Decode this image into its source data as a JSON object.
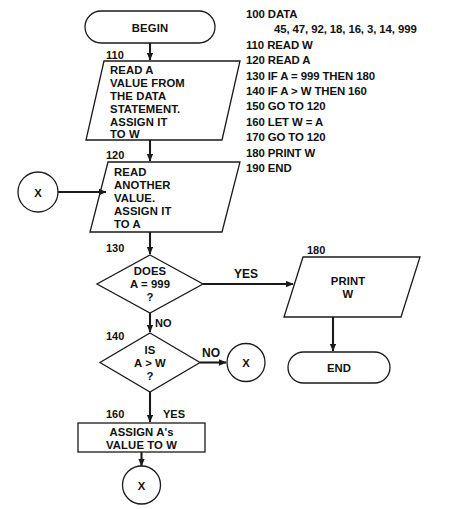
{
  "diagram": {
    "nodes": {
      "begin": {
        "label": "BEGIN",
        "type": "terminator"
      },
      "read_w": {
        "step": "110",
        "type": "io-parallelogram",
        "lines": [
          "READ A",
          "VALUE FROM",
          "THE DATA",
          "STATEMENT.",
          "ASSIGN IT",
          "TO W"
        ]
      },
      "read_a": {
        "step": "120",
        "type": "io-parallelogram",
        "lines": [
          "READ",
          "ANOTHER",
          "VALUE.",
          "ASSIGN IT",
          "TO A"
        ]
      },
      "test_999": {
        "step": "130",
        "type": "decision",
        "lines": [
          "DOES",
          "A = 999",
          "?"
        ]
      },
      "test_gt": {
        "step": "140",
        "type": "decision",
        "lines": [
          "IS",
          "A > W",
          "?"
        ]
      },
      "assign": {
        "step": "160",
        "type": "process",
        "lines": [
          "ASSIGN A's",
          "VALUE TO W"
        ]
      },
      "print_w": {
        "step": "180",
        "type": "io-parallelogram",
        "lines": [
          "PRINT",
          "W"
        ]
      },
      "end": {
        "label": "END",
        "type": "terminator"
      },
      "connector_left": {
        "label": "X",
        "type": "connector"
      },
      "connector_right": {
        "label": "X",
        "type": "connector"
      },
      "connector_bottom": {
        "label": "X",
        "type": "connector"
      }
    },
    "branch_labels": {
      "yes_999": "YES",
      "no_999": "NO",
      "no_gt": "NO",
      "yes_gt": "YES"
    }
  },
  "code": {
    "lines": [
      {
        "text": "100 DATA",
        "indent": false
      },
      {
        "text": "45, 47, 92, 18, 16, 3, 14, 999",
        "indent": true
      },
      {
        "text": "110 READ W",
        "indent": false
      },
      {
        "text": "120 READ A",
        "indent": false
      },
      {
        "text": "130 IF A = 999 THEN 180",
        "indent": false
      },
      {
        "text": "140 IF A > W THEN 160",
        "indent": false
      },
      {
        "text": "150 GO TO 120",
        "indent": false
      },
      {
        "text": "160 LET W = A",
        "indent": false
      },
      {
        "text": "170 GO TO 120",
        "indent": false
      },
      {
        "text": "180 PRINT W",
        "indent": false
      },
      {
        "text": "190 END",
        "indent": false
      }
    ]
  },
  "colors": {
    "ink": "#1a1a1a",
    "paper": "#ffffff"
  }
}
